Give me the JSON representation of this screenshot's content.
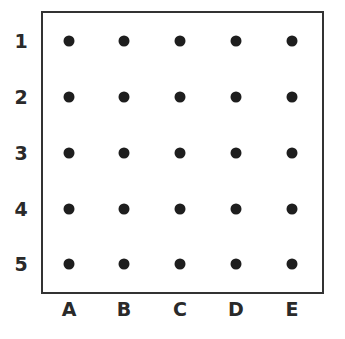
{
  "grid": {
    "rows": [
      "1",
      "2",
      "3",
      "4",
      "5"
    ],
    "columns": [
      "A",
      "B",
      "C",
      "D",
      "E"
    ],
    "dot_color": "#1e1e1e",
    "border_color": "#333333"
  }
}
